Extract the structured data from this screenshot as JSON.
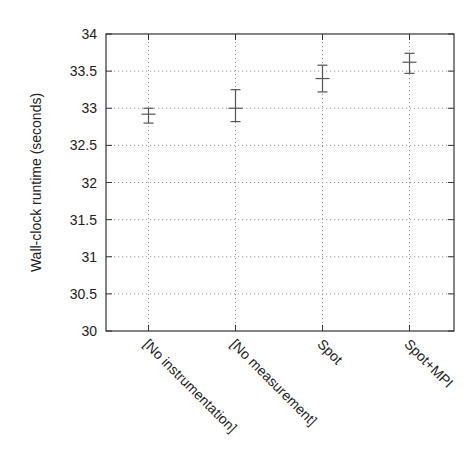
{
  "chart_data": {
    "type": "errorbar",
    "title": "",
    "xlabel": "",
    "ylabel": "Wall-clock runtime (seconds)",
    "ylim": [
      30,
      34
    ],
    "yticks": [
      30,
      30.5,
      31,
      31.5,
      32,
      32.5,
      33,
      33.5,
      34
    ],
    "ytick_labels": [
      "30",
      "30.5",
      "31",
      "31.5",
      "32",
      "32.5",
      "33",
      "33.5",
      "34"
    ],
    "grid": true,
    "legend": null,
    "categories": [
      "[No instrumentation]",
      "[No measurement]",
      "Spot",
      "Spot+MPI"
    ],
    "values": [
      32.92,
      33.0,
      33.4,
      33.62
    ],
    "error_low": [
      32.8,
      32.82,
      33.22,
      33.47
    ],
    "error_high": [
      33.0,
      33.25,
      33.58,
      33.74
    ]
  },
  "style": {
    "axis_color": "#333333",
    "grid_color": "#9a9a9a",
    "errorbar_color": "#555555"
  }
}
